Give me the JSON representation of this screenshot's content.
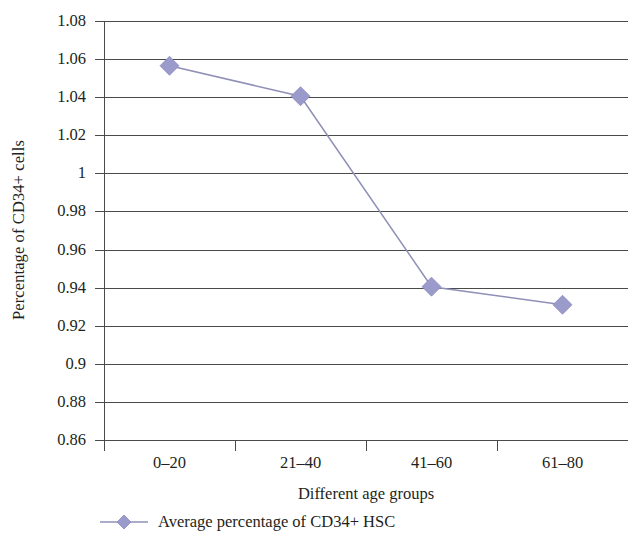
{
  "chart_data": {
    "type": "line",
    "title": "",
    "xlabel": "Different age groups",
    "ylabel": "Percentage of CD34+ cells",
    "categories": [
      "0–20",
      "21–40",
      "41–60",
      "61–80"
    ],
    "series": [
      {
        "name": "Average percentage of CD34+ HSC",
        "values": [
          1.0565,
          1.0405,
          0.9405,
          0.931
        ],
        "color": "#9b9bcb",
        "line_color": "#8f8fb8",
        "marker": "diamond"
      }
    ],
    "ylim": [
      0.86,
      1.08
    ],
    "y_ticks": [
      "1.08",
      "1.06",
      "1.04",
      "1.02",
      "1",
      "0.98",
      "0.96",
      "0.94",
      "0.92",
      "0.9",
      "0.88",
      "0.86"
    ],
    "y_tick_values": [
      1.08,
      1.06,
      1.04,
      1.02,
      1.0,
      0.98,
      0.96,
      0.94,
      0.92,
      0.9,
      0.88,
      0.86
    ],
    "grid": true,
    "grid_color": "#4a4a4a",
    "legend_position": "bottom-left",
    "legend_entries": [
      "Average percentage of CD34+ HSC"
    ]
  },
  "colors": {
    "marker": "#9b9bcb",
    "line": "#8f8fb8",
    "axis": "#4a4a4a",
    "text": "#231f20",
    "background": "#ffffff"
  },
  "axes": {
    "y_title": "Percentage of CD34+ cells",
    "x_title": "Different age groups"
  },
  "legend": {
    "label": "Average percentage of CD34+ HSC"
  }
}
